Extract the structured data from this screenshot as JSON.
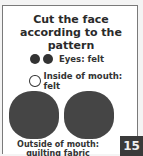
{
  "title": "Cut the face according to the pattern",
  "legend": [
    {
      "icon": "filled-circle-icon",
      "count": 2,
      "label": "Eyes: felt"
    },
    {
      "icon": "outline-circle-icon",
      "count": 1,
      "label": "Inside of mouth: felt"
    }
  ],
  "pattern_caption": "Outside of mouth: quilting fabric",
  "page_number": "15",
  "colors": {
    "shape_fill": "#454545",
    "page_badge": "#3a3a3a"
  }
}
